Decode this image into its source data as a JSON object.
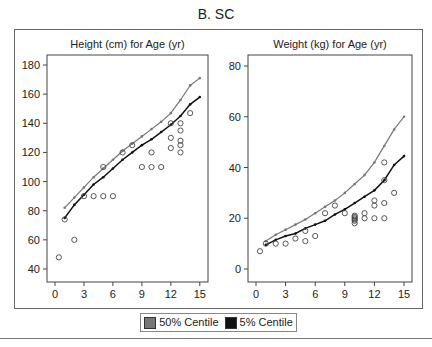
{
  "title": "B. SC",
  "legend": {
    "items": [
      {
        "label": "50% Centile",
        "color": "#777777"
      },
      {
        "label": "5% Centile",
        "color": "#111111"
      }
    ]
  },
  "chart_data": [
    {
      "type": "line",
      "title": "Height (cm) for Age (yr)",
      "xlabel": "",
      "ylabel": "",
      "xlim": [
        0,
        15
      ],
      "ylim": [
        35,
        185
      ],
      "xticks": [
        0,
        3,
        6,
        9,
        12,
        15
      ],
      "yticks": [
        40,
        60,
        80,
        100,
        120,
        140,
        160,
        180
      ],
      "grid": false,
      "series": [
        {
          "name": "50% Centile",
          "color": "#777777",
          "x": [
            1,
            2,
            3,
            4,
            5,
            6,
            7,
            8,
            9,
            10,
            11,
            12,
            13,
            14,
            15
          ],
          "values": [
            82,
            89,
            96,
            103,
            109,
            115,
            121,
            126,
            131,
            136,
            141,
            147,
            156,
            166,
            171
          ]
        },
        {
          "name": "5% Centile",
          "color": "#111111",
          "x": [
            1,
            2,
            3,
            4,
            5,
            6,
            7,
            8,
            9,
            10,
            11,
            12,
            13,
            14,
            15
          ],
          "values": [
            75,
            84,
            91,
            98,
            103,
            109,
            115,
            120,
            125,
            129,
            134,
            139,
            145,
            153,
            158
          ]
        },
        {
          "name": "Observed",
          "type": "scatter",
          "marker": "open-circle",
          "x": [
            0.4,
            1,
            2,
            3,
            4,
            5,
            6,
            5,
            7,
            8,
            9,
            10,
            10,
            11,
            12,
            12,
            12,
            13,
            13,
            13,
            13,
            13,
            14
          ],
          "values": [
            48,
            74,
            60,
            90,
            90,
            90,
            90,
            110,
            120,
            125,
            110,
            110,
            120,
            110,
            130,
            123,
            140,
            140,
            135,
            128,
            125,
            120,
            147
          ]
        }
      ]
    },
    {
      "type": "line",
      "title": "Weight (kg) for Age (yr)",
      "xlabel": "",
      "ylabel": "",
      "xlim": [
        0,
        15
      ],
      "ylim": [
        -4,
        84
      ],
      "xticks": [
        0,
        3,
        6,
        9,
        12,
        15
      ],
      "yticks": [
        0,
        20,
        40,
        60,
        80
      ],
      "grid": false,
      "series": [
        {
          "name": "50% Centile",
          "color": "#777777",
          "x": [
            1,
            2,
            3,
            4,
            5,
            6,
            7,
            8,
            9,
            10,
            11,
            12,
            13,
            14,
            15
          ],
          "values": [
            11,
            13.5,
            15.5,
            17.5,
            19.5,
            22,
            24.5,
            27,
            30,
            33.5,
            37,
            42,
            48.5,
            55,
            60
          ]
        },
        {
          "name": "5% Centile",
          "color": "#111111",
          "x": [
            1,
            2,
            3,
            4,
            5,
            6,
            7,
            8,
            9,
            10,
            11,
            12,
            13,
            14,
            15
          ],
          "values": [
            9.5,
            11.5,
            13,
            14,
            16,
            17.5,
            19,
            21.5,
            23.5,
            26,
            28.5,
            31,
            35,
            41,
            44.5
          ]
        },
        {
          "name": "Observed",
          "type": "scatter",
          "marker": "open-circle",
          "x": [
            0.4,
            1,
            2,
            3,
            4,
            5,
            5,
            6,
            7,
            8,
            9,
            10,
            10,
            10,
            10,
            10,
            10,
            11,
            11,
            12,
            12,
            12,
            13,
            13,
            13,
            13,
            14
          ],
          "values": [
            7,
            10,
            10,
            10,
            12,
            11,
            15,
            13,
            22,
            25,
            22,
            18,
            19,
            20,
            21,
            20.5,
            19.5,
            22,
            20,
            20,
            25,
            27,
            26,
            20,
            35,
            42,
            30
          ]
        }
      ]
    }
  ]
}
